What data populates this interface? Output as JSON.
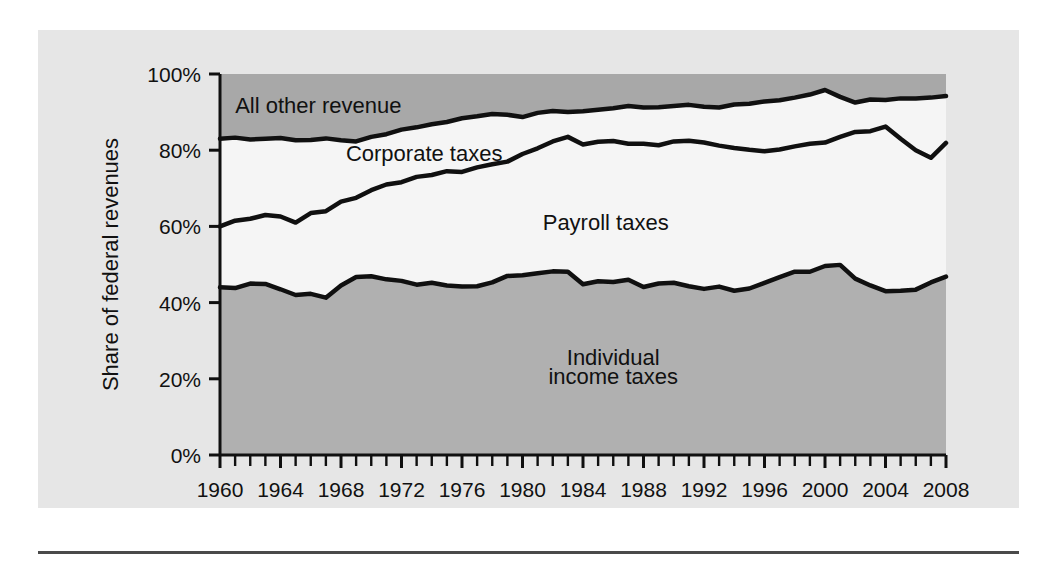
{
  "figure": {
    "panel_color": "#e6e6e6",
    "page_background": "#ffffff",
    "rule_color": "#4a4a4a"
  },
  "chart_data": {
    "type": "area",
    "title": "",
    "subtitle": "",
    "xlabel": "",
    "ylabel": "Share of federal revenues",
    "xlim": [
      1960,
      2008
    ],
    "ylim": [
      0,
      100
    ],
    "y_tick_labels": [
      "0%",
      "20%",
      "40%",
      "60%",
      "80%",
      "100%"
    ],
    "y_ticks": [
      0,
      20,
      40,
      60,
      80,
      100
    ],
    "x_tick_labels": [
      "1960",
      "1964",
      "1968",
      "1972",
      "1976",
      "1980",
      "1984",
      "1988",
      "1992",
      "1996",
      "2000",
      "2004",
      "2008"
    ],
    "x_major_ticks": [
      1960,
      1964,
      1968,
      1972,
      1976,
      1980,
      1984,
      1988,
      1992,
      1996,
      2000,
      2004,
      2008
    ],
    "x_minor_tick_step": 1,
    "grid": false,
    "legend_position": "in-plot-annotations",
    "stacking": "cumulative-percent",
    "annotations": [
      {
        "name": "all-other-revenue",
        "text": "All other revenue",
        "x": 1966.5,
        "y": 91.5
      },
      {
        "name": "corporate-taxes",
        "text": "Corporate taxes",
        "x": 1973.5,
        "y": 79.0
      },
      {
        "name": "payroll-taxes",
        "text": "Payroll taxes",
        "x": 1985.5,
        "y": 61.0
      },
      {
        "name": "individual-income-taxes-line1",
        "text": "Individual",
        "x": 1986.0,
        "y": 25.5
      },
      {
        "name": "individual-income-taxes-line2",
        "text": "income taxes",
        "x": 1986.0,
        "y": 20.5
      }
    ],
    "x": [
      1960,
      1961,
      1962,
      1963,
      1964,
      1965,
      1966,
      1967,
      1968,
      1969,
      1970,
      1971,
      1972,
      1973,
      1974,
      1975,
      1976,
      1977,
      1978,
      1979,
      1980,
      1981,
      1982,
      1983,
      1984,
      1985,
      1986,
      1987,
      1988,
      1989,
      1990,
      1991,
      1992,
      1993,
      1994,
      1995,
      1996,
      1997,
      1998,
      1999,
      2000,
      2001,
      2002,
      2003,
      2004,
      2005,
      2006,
      2007,
      2008
    ],
    "series": [
      {
        "name": "Individual income taxes",
        "fill": "#b0b0b0",
        "values": [
          44.0,
          43.8,
          45.0,
          44.9,
          43.5,
          42.0,
          42.3,
          41.3,
          44.5,
          46.7,
          46.9,
          46.1,
          45.7,
          44.7,
          45.2,
          44.5,
          44.2,
          44.3,
          45.3,
          47.0,
          47.2,
          47.7,
          48.2,
          48.1,
          44.8,
          45.6,
          45.4,
          46.0,
          44.1,
          45.0,
          45.2,
          44.3,
          43.6,
          44.2,
          43.1,
          43.7,
          45.2,
          46.7,
          48.1,
          48.1,
          49.6,
          49.9,
          46.3,
          44.5,
          43.0,
          43.1,
          43.4,
          45.3,
          45.4
        ],
        "value_2008": 46.8
      },
      {
        "name": "Payroll taxes",
        "fill": "#f5f5f5",
        "cumulative": [
          60.0,
          61.5,
          62.0,
          63.0,
          62.6,
          61.0,
          63.5,
          64.0,
          66.5,
          67.5,
          69.5,
          71.0,
          71.6,
          73.0,
          73.5,
          74.5,
          74.3,
          75.5,
          76.3,
          77.0,
          79.0,
          80.5,
          82.3,
          83.5,
          81.5,
          82.2,
          82.4,
          81.7,
          81.7,
          81.3,
          82.3,
          82.5,
          82.0,
          81.2,
          80.6,
          80.1,
          79.7,
          80.2,
          81.0,
          81.7,
          82.0,
          83.5,
          84.8,
          85.0,
          86.2,
          83.0,
          80.0,
          78.0,
          80.0
        ],
        "value_2008": 81.9
      },
      {
        "name": "Corporate taxes",
        "fill": "#f5f5f5",
        "note": "Corporate taxes is the band between the payroll cumulative line and the 'all other revenue' lower boundary"
      },
      {
        "name": "All other revenue",
        "fill": "#a8a8a8",
        "cumulative": [
          83.0,
          83.3,
          82.8,
          83.0,
          83.2,
          82.6,
          82.7,
          83.1,
          82.6,
          82.3,
          83.5,
          84.2,
          85.4,
          86.0,
          86.8,
          87.4,
          88.4,
          88.9,
          89.5,
          89.3,
          88.7,
          89.8,
          90.3,
          90.0,
          90.2,
          90.6,
          91.0,
          91.6,
          91.2,
          91.3,
          91.6,
          91.9,
          91.4,
          91.2,
          92.0,
          92.2,
          92.8,
          93.1,
          93.8,
          94.6,
          95.8,
          94.0,
          92.5,
          93.3,
          93.2,
          93.6,
          93.6,
          93.8,
          94.0
        ],
        "value_2008": 94.2
      }
    ],
    "top_band_name": "All other revenue",
    "top_band_fill": "#a8a8a8",
    "middle_band_fill": "#f5f5f5",
    "bottom_band_fill": "#b0b0b0",
    "line_color": "#101010"
  }
}
